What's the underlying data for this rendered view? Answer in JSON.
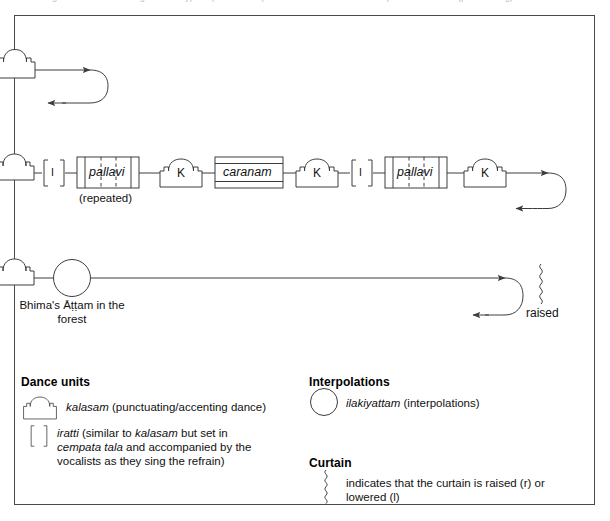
{
  "caption_strip": "Figure 8. Structural diagram of a typical padam: the pallavi and caranam with interpolated kalasam (punctuating) dance units",
  "diagram": {
    "row1": {
      "kalasam_letter": "",
      "note": "curtain-lowered kalasam glyph with U-turn continuation arrow"
    },
    "row2": {
      "nodes": [
        {
          "type": "kalasam-partial",
          "label": ""
        },
        {
          "type": "iratti",
          "label": "I"
        },
        {
          "type": "section",
          "label": "pallavi",
          "sub": "(repeated)"
        },
        {
          "type": "kalasam",
          "label": "K"
        },
        {
          "type": "section-caranam",
          "label": "caranam",
          "sub": ""
        },
        {
          "type": "kalasam",
          "label": "K"
        },
        {
          "type": "iratti",
          "label": "I"
        },
        {
          "type": "section",
          "label": "pallavi",
          "sub": "(repeated)"
        },
        {
          "type": "kalasam",
          "label": "K"
        }
      ]
    },
    "row3": {
      "circle_label": "Bhima's Āṭṭam in the forest",
      "curtain_label": "raised"
    }
  },
  "legend": {
    "dance_units": {
      "heading": "Dance units",
      "items": [
        {
          "icon": "kalasam-icon",
          "icon_letter": "K",
          "term": "kalasam",
          "desc": " (punctuating/accenting dance)"
        },
        {
          "icon": "iratti-icon",
          "icon_letter": "I",
          "term": "iratti",
          "desc_pre": " (similar to ",
          "desc_em": "kalasam",
          "desc_mid": " but set in ",
          "desc_em2": "cempata tala",
          "desc_post": " and accompanied by the vocalists as they sing the refrain)"
        }
      ]
    },
    "interpolations": {
      "heading": "Interpolations",
      "icon": "circle-icon",
      "term": "ilakiyattam",
      "desc": " (interpolations)"
    },
    "curtain": {
      "heading": "Curtain",
      "icon": "curtain-squiggle-icon",
      "desc": "indicates that the curtain is raised (r) or lowered (l)"
    }
  },
  "colors": {
    "frame": "#4a4a4a",
    "stroke": "#3c3c3c",
    "text": "#111111",
    "caption": "#b9b9bf"
  }
}
